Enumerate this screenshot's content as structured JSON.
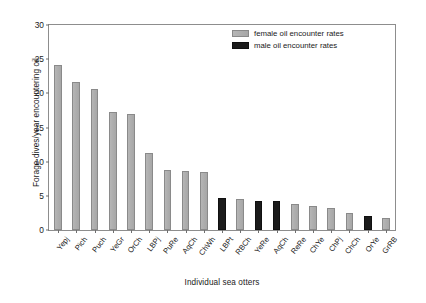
{
  "chart_data": {
    "type": "bar",
    "title": "",
    "xlabel": "Individual sea otters",
    "ylabel": "Forage dives/year encountering oil",
    "ylim": [
      0,
      30
    ],
    "yticks": [
      0,
      5,
      10,
      15,
      20,
      25,
      30
    ],
    "grid": false,
    "legend_position": "top-right",
    "categories": [
      "Yepj",
      "Pich",
      "Puch",
      "YeGr",
      "OrCh",
      "LBPj",
      "PuRe",
      "AqCh",
      "ChWh",
      "LBPt",
      "RBCh",
      "YeRe",
      "AqCh",
      "ReRe",
      "ChYe",
      "ChPj",
      "ChCh",
      "OrYe",
      "GrRB"
    ],
    "values": [
      24.2,
      21.7,
      20.7,
      17.3,
      17.0,
      11.3,
      8.8,
      8.6,
      8.5,
      4.7,
      4.5,
      4.3,
      4.2,
      3.8,
      3.5,
      3.2,
      2.5,
      2.0,
      1.7
    ],
    "groups": [
      "female",
      "female",
      "female",
      "female",
      "female",
      "female",
      "female",
      "female",
      "female",
      "male",
      "female",
      "male",
      "male",
      "female",
      "female",
      "female",
      "female",
      "male",
      "female"
    ],
    "series": [
      {
        "name": "female oil encounter rates",
        "color": "#b0b0b0"
      },
      {
        "name": "male oil encounter rates",
        "color": "#1b1b1b"
      }
    ]
  },
  "legend": {
    "items": [
      {
        "label": "female oil encounter rates",
        "group": "female"
      },
      {
        "label": "male oil encounter rates",
        "group": "male"
      }
    ]
  },
  "colors": {
    "female": "#b0b0b0",
    "male": "#1b1b1b",
    "axis": "#8d8d8d",
    "text": "#1a1a1a"
  }
}
